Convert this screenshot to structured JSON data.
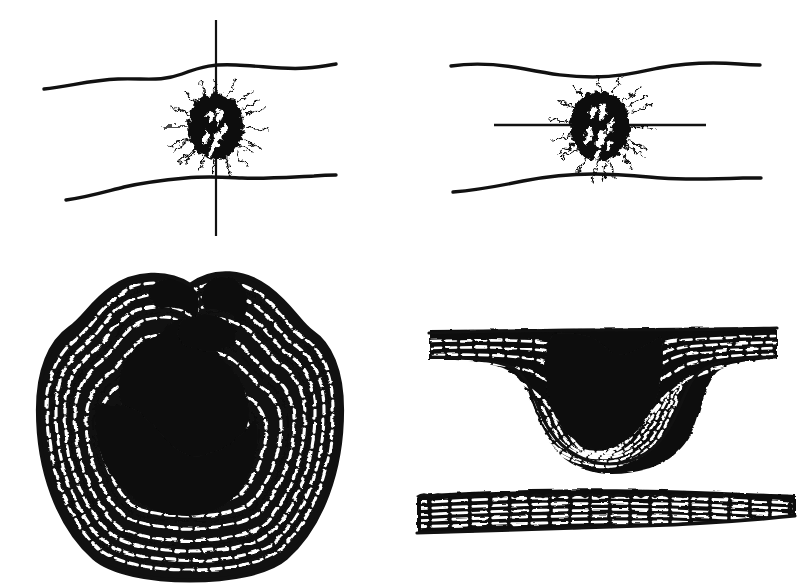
{
  "figure": {
    "background_color": "#ffffff",
    "ink_color": "#111111",
    "width_px": 806,
    "height_px": 585,
    "panel_count": 4,
    "has_visible_text": false,
    "caption": ""
  },
  "panels": [
    {
      "id": "top-left",
      "name": "bark-surface-with-vertical-axis",
      "description": "Bark surface in plan view: two wavy horizontal contour lines with a dark spiky wound blob centered between them, crossed by a straight vertical axis line.",
      "elements": {
        "upper_contour": "wavy-line",
        "lower_contour": "wavy-line",
        "axis": "vertical-line",
        "wound": "dark-spiky-blob-with-white-flecks"
      },
      "geometry": {
        "upper_line_start": [
          44,
          89
        ],
        "upper_line_end": [
          336,
          65
        ],
        "lower_line_start": [
          66,
          200
        ],
        "lower_line_end": [
          336,
          176
        ],
        "axis_x": 216,
        "axis_top": 20,
        "axis_bottom": 236,
        "blob_center": [
          216,
          125
        ],
        "blob_radius_x": 28,
        "blob_radius_y": 33
      }
    },
    {
      "id": "top-right",
      "name": "bark-surface-with-horizontal-axis",
      "description": "Same bark surface rotated: two wavy horizontal contour lines pinching toward the middle with the dark spiky wound blob centered, crossed by a straight horizontal axis line.",
      "elements": {
        "upper_contour": "wavy-line",
        "lower_contour": "wavy-line",
        "axis": "horizontal-line",
        "wound": "dark-spiky-blob-with-white-flecks"
      },
      "geometry": {
        "upper_line_start": [
          451,
          66
        ],
        "upper_line_end": [
          758,
          64
        ],
        "lower_line_start": [
          453,
          192
        ],
        "lower_line_end": [
          760,
          180
        ],
        "axis_y": 125,
        "axis_left": 494,
        "axis_right": 706,
        "blob_center": [
          600,
          125
        ],
        "blob_radius_x": 30,
        "blob_radius_y": 35
      }
    },
    {
      "id": "bottom-left",
      "name": "transverse-section-of-wound",
      "description": "Transverse (cross) section of the trunk: roughly circular outline with two raised callus lips at the top, a large black wound cavity in the centre and concentric hatched annual-ring wood grain wrapping around it.",
      "elements": {
        "outline": "closed-rounded-contour",
        "cavity": "black-wound-cavity",
        "grain": "concentric-hatched-growth-rings",
        "callus_lips": 2
      },
      "geometry": {
        "bounds": [
          38,
          285,
          342,
          580
        ],
        "center": [
          190,
          436
        ],
        "cavity_center": [
          190,
          440
        ]
      }
    },
    {
      "id": "bottom-right",
      "name": "longitudinal-section-of-wound",
      "description": "Longitudinal section: a flat grained band interrupted by a broad V-shaped depression filled with black wound tissue and nested curving growth rings; a separate straight grained band with a bumpy upper edge lies below.",
      "elements": {
        "upper_band": "grained-band-with-depression",
        "depression": "v-shaped-black-wound",
        "grain": "nested-curving-growth-rings",
        "lower_band": "straight-grained-band-with-bumpy-edge"
      },
      "geometry": {
        "upper_band_bounds": [
          428,
          330,
          778,
          465
        ],
        "depression_center": [
          600,
          400
        ],
        "lower_band_bounds": [
          420,
          492,
          792,
          530
        ]
      }
    }
  ]
}
